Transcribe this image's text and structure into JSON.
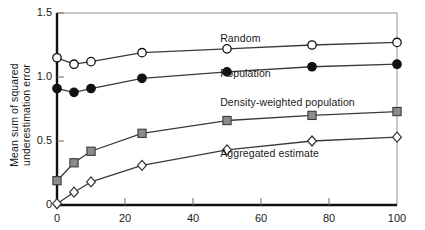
{
  "chart_data": {
    "type": "line",
    "title": "",
    "xlabel": "",
    "ylabel": "Mean sum of squared\nunderestimation error",
    "xlim": [
      0,
      100
    ],
    "ylim": [
      0,
      1.5
    ],
    "xticks": [
      0,
      20,
      40,
      60,
      80,
      100
    ],
    "xtick_labels": [
      "0",
      "20",
      "40",
      "60",
      "80",
      "100"
    ],
    "yticks": [
      0,
      0.5,
      1.0,
      1.5
    ],
    "ytick_labels": [
      "0",
      "0.5",
      "1.0",
      "1.5"
    ],
    "grid": false,
    "legend_position": "inline-annotations",
    "x": [
      0,
      5,
      10,
      25,
      50,
      75,
      100
    ],
    "series": [
      {
        "name": "Random",
        "marker": "open-circle",
        "color": "#333333",
        "values": [
          1.15,
          1.1,
          1.12,
          1.19,
          1.22,
          1.25,
          1.27
        ],
        "label_x": 48,
        "label_y": 1.3
      },
      {
        "name": "Population",
        "marker": "filled-circle",
        "color": "#111111",
        "values": [
          0.91,
          0.88,
          0.91,
          0.99,
          1.04,
          1.08,
          1.1
        ],
        "label_x": 48,
        "label_y": 1.02
      },
      {
        "name": "Density-weighted population",
        "marker": "filled-square",
        "color": "#8c8c8c",
        "values": [
          0.19,
          0.33,
          0.42,
          0.56,
          0.66,
          0.7,
          0.73
        ],
        "label_x": 48,
        "label_y": 0.8
      },
      {
        "name": "Aggregated estimate",
        "marker": "open-diamond",
        "color": "#444444",
        "values": [
          0.01,
          0.1,
          0.18,
          0.31,
          0.43,
          0.5,
          0.53
        ],
        "label_x": 48,
        "label_y": 0.4
      }
    ]
  }
}
